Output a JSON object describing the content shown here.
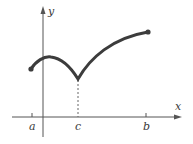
{
  "diagram": {
    "type": "function-graph",
    "axes": {
      "x_label": "x",
      "y_label": "y"
    },
    "tick_labels": {
      "a": "a",
      "c": "c",
      "b": "b"
    },
    "curve": {
      "description": "continuous curve from a to b with a cusp (corner) at c",
      "endpoints": [
        "a",
        "b"
      ],
      "cusp_at": "c"
    },
    "colors": {
      "curve": "#3c3c3c",
      "axes": "#555555",
      "dashed_line": "#666666"
    }
  }
}
